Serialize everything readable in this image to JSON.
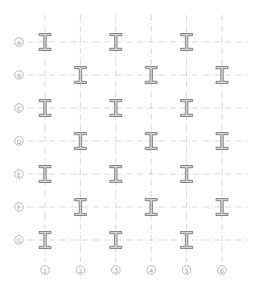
{
  "colors": {
    "grid_line": "#c8c8c8",
    "bubble_stroke": "#a8a8a8",
    "label_text": "#9a9a9a",
    "beam_fill": "#d4d4d4",
    "beam_stroke": "#6e6e6e"
  },
  "grid": {
    "rows": [
      "A",
      "B",
      "C",
      "D",
      "E",
      "F",
      "G"
    ],
    "columns": [
      "1",
      "2",
      "3",
      "4",
      "5",
      "6"
    ]
  },
  "columns_placed": [
    {
      "row": "A",
      "col": "1"
    },
    {
      "row": "A",
      "col": "3"
    },
    {
      "row": "A",
      "col": "5"
    },
    {
      "row": "B",
      "col": "2"
    },
    {
      "row": "B",
      "col": "4"
    },
    {
      "row": "B",
      "col": "6"
    },
    {
      "row": "C",
      "col": "1"
    },
    {
      "row": "C",
      "col": "3"
    },
    {
      "row": "C",
      "col": "5"
    },
    {
      "row": "D",
      "col": "2"
    },
    {
      "row": "D",
      "col": "4"
    },
    {
      "row": "D",
      "col": "6"
    },
    {
      "row": "E",
      "col": "1"
    },
    {
      "row": "E",
      "col": "3"
    },
    {
      "row": "E",
      "col": "5"
    },
    {
      "row": "F",
      "col": "2"
    },
    {
      "row": "F",
      "col": "4"
    },
    {
      "row": "F",
      "col": "6"
    },
    {
      "row": "G",
      "col": "1"
    },
    {
      "row": "G",
      "col": "3"
    },
    {
      "row": "G",
      "col": "5"
    }
  ],
  "column_symbol": "i-beam-icon"
}
